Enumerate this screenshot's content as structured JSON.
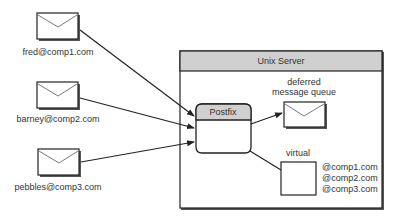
{
  "senders": [
    {
      "address": "fred@comp1.com",
      "icon": "envelope-icon"
    },
    {
      "address": "barney@comp2.com",
      "icon": "envelope-icon"
    },
    {
      "address": "pebbles@comp3.com",
      "icon": "envelope-icon"
    }
  ],
  "server": {
    "title": "Unix Server",
    "mta": {
      "label": "Postfix"
    },
    "deferred": {
      "line1": "deferred",
      "line2": "message queue",
      "icon": "envelope-icon"
    },
    "virtual": {
      "label": "virtual",
      "domains": [
        "@comp1.com",
        "@comp2.com",
        "@comp3.com"
      ]
    }
  },
  "colors": {
    "header_fill": "#d0d0d0",
    "stroke": "#222222",
    "shadow": "#555555"
  }
}
